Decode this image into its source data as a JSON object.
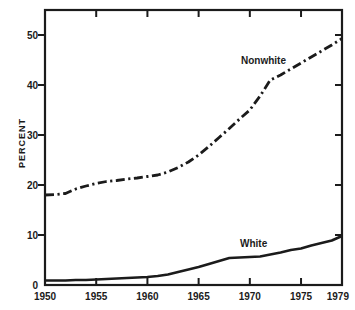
{
  "chart_data": {
    "type": "line",
    "title": "",
    "xlabel": "",
    "ylabel": "PERCENT",
    "xlim": [
      1950,
      1979
    ],
    "ylim": [
      0,
      55
    ],
    "x_ticks": [
      1950,
      1955,
      1960,
      1965,
      1970,
      1975,
      1979
    ],
    "y_ticks": [
      0,
      10,
      20,
      30,
      40,
      50
    ],
    "grid": false,
    "frame": "box",
    "legend_position": "inline-labels",
    "colors": {
      "line": "#1b1b1b",
      "text": "#1b1b1b",
      "background": "#ffffff"
    },
    "x": [
      1950,
      1951,
      1952,
      1953,
      1954,
      1955,
      1956,
      1957,
      1958,
      1959,
      1960,
      1961,
      1962,
      1963,
      1964,
      1965,
      1966,
      1967,
      1968,
      1969,
      1970,
      1971,
      1972,
      1973,
      1974,
      1975,
      1976,
      1977,
      1978,
      1979
    ],
    "series": [
      {
        "name": "nonwhite",
        "label": "Nonwhite",
        "style": "dash-dot",
        "values": [
          18.0,
          18.1,
          18.3,
          19.2,
          19.8,
          20.3,
          20.7,
          20.9,
          21.2,
          21.4,
          21.7,
          22.0,
          22.6,
          23.5,
          24.6,
          26.0,
          27.7,
          29.5,
          31.3,
          33.2,
          35.0,
          37.8,
          41.0,
          42.0,
          43.2,
          44.4,
          45.6,
          46.8,
          48.0,
          49.3
        ]
      },
      {
        "name": "white",
        "label": "White",
        "style": "solid",
        "values": [
          0.9,
          0.9,
          0.9,
          1.0,
          1.0,
          1.1,
          1.2,
          1.3,
          1.4,
          1.5,
          1.6,
          1.8,
          2.1,
          2.6,
          3.1,
          3.6,
          4.2,
          4.8,
          5.4,
          5.5,
          5.6,
          5.7,
          6.1,
          6.5,
          7.0,
          7.3,
          7.9,
          8.4,
          8.9,
          9.8
        ]
      }
    ]
  }
}
